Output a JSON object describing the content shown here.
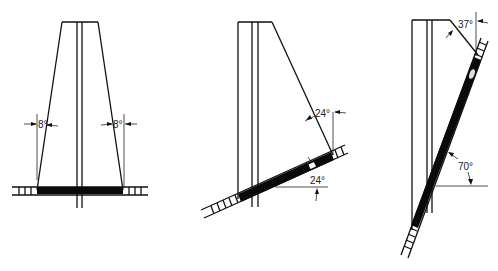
{
  "diagram": {
    "type": "ladder-angle-illustration",
    "figures": [
      {
        "id": "fig-1",
        "description": "Vertical structure with two tapered sides, ladder laid flat at base",
        "angles": [
          {
            "label": "8°",
            "position": "left side"
          },
          {
            "label": "8°",
            "position": "right side"
          }
        ]
      },
      {
        "id": "fig-2",
        "description": "Structure with one slanted side resting on ladder inclined at 24°",
        "angles": [
          {
            "label": "24°",
            "position": "between slanted side and vertical"
          },
          {
            "label": "24°",
            "position": "ladder incline from horizontal"
          }
        ]
      },
      {
        "id": "fig-3",
        "description": "Steep ladder leaning against structure top corner",
        "angles": [
          {
            "label": "37°",
            "position": "top slanted edge from vertical"
          },
          {
            "label": "70°",
            "position": "ladder incline from horizontal"
          }
        ]
      }
    ]
  }
}
